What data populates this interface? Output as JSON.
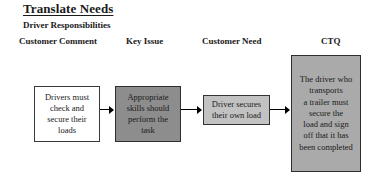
{
  "document": {
    "title": "Translate Needs",
    "subtitle": "Driver Responsibilities"
  },
  "columns": [
    {
      "label": "Customer Comment"
    },
    {
      "label": "Key Issue"
    },
    {
      "label": "Customer Need"
    },
    {
      "label": "CTQ"
    }
  ],
  "flow": {
    "boxes": [
      {
        "id": "customer-comment",
        "text": "Drivers must\ncheck and\nsecure their\nloads",
        "fill": "#ffffff",
        "border": "#3a3a3a"
      },
      {
        "id": "key-issue",
        "text": "Appropriate\nskills should\nperform the\ntask",
        "fill": "#8d8d8d",
        "border": "#2e2e2e"
      },
      {
        "id": "customer-need",
        "text": "Driver secures\ntheir own load",
        "fill": "#c2c2c2",
        "border": "#333333"
      },
      {
        "id": "ctq",
        "text": "The driver who\ntransports\na trailer must\nsecure the\nload and sign\noff that it has\nbeen completed",
        "fill": "#aaaaaa",
        "border": "#2e2e2e"
      }
    ],
    "connectors": [
      {
        "id": "arrow-comment-to-issue",
        "direction": "right"
      },
      {
        "id": "arrow-issue-to-need",
        "direction": "right"
      },
      {
        "id": "arrow-need-to-ctq",
        "direction": "right"
      }
    ]
  }
}
